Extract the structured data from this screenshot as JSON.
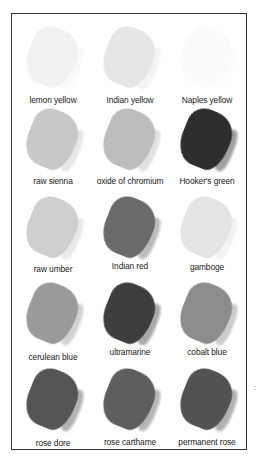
{
  "page": {
    "margin_mark": ":"
  },
  "swatches": [
    {
      "label": "lemon yellow",
      "color": "#f1f1f1",
      "row": 0,
      "col": 0
    },
    {
      "label": "Indian yellow",
      "color": "#e6e6e6",
      "row": 0,
      "col": 1
    },
    {
      "label": "Naples yellow",
      "color": "#fafafa",
      "row": 0,
      "col": 2
    },
    {
      "label": "raw sienna",
      "color": "#c8c8c8",
      "row": 1,
      "col": 0
    },
    {
      "label": "oxide of chromium",
      "color": "#bdbdbd",
      "row": 1,
      "col": 1
    },
    {
      "label": "Hooker's green",
      "color": "#2e2e2e",
      "row": 1,
      "col": 2
    },
    {
      "label": "raw umber",
      "color": "#cfcfcf",
      "row": 2,
      "col": 0
    },
    {
      "label": "Indian red",
      "color": "#6a6a6a",
      "row": 2,
      "col": 1
    },
    {
      "label": "gamboge",
      "color": "#e4e4e4",
      "row": 2,
      "col": 2
    },
    {
      "label": "cerulean blue",
      "color": "#9a9a9a",
      "row": 3,
      "col": 0
    },
    {
      "label": "ultramarine",
      "color": "#3e3e3e",
      "row": 3,
      "col": 1
    },
    {
      "label": "cobalt blue",
      "color": "#8c8c8c",
      "row": 3,
      "col": 2
    },
    {
      "label": "rose dore",
      "color": "#555555",
      "row": 4,
      "col": 0
    },
    {
      "label": "rose carthame",
      "color": "#5e5e5e",
      "row": 4,
      "col": 1
    },
    {
      "label": "permanent rose",
      "color": "#525252",
      "row": 4,
      "col": 2
    }
  ]
}
